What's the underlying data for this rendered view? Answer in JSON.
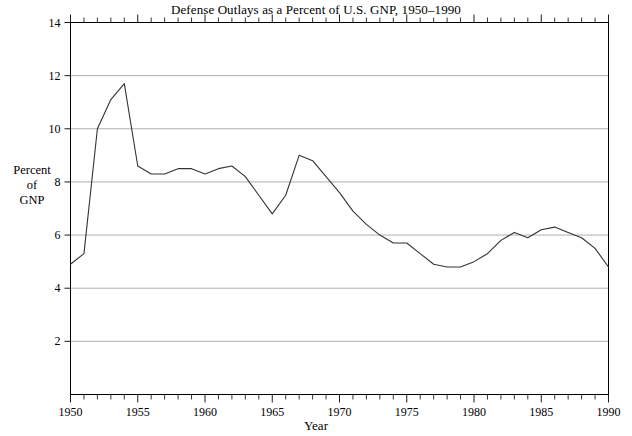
{
  "chart_data": {
    "type": "line",
    "title": "Defense Outlays as a Percent of U.S. GNP, 1950–1990",
    "xlabel": "Year",
    "ylabel": "Percent of GNP",
    "ylabel_lines": [
      "Percent",
      "of",
      "GNP"
    ],
    "xlim": [
      1950,
      1990
    ],
    "ylim": [
      0,
      14
    ],
    "yticks": [
      2,
      4,
      6,
      8,
      10,
      12,
      14
    ],
    "ytick_labels": [
      "2",
      "4",
      "6",
      "8",
      "10",
      "12",
      "14"
    ],
    "xticks": [
      1950,
      1955,
      1960,
      1965,
      1970,
      1975,
      1980,
      1985,
      1990
    ],
    "xtick_labels": [
      "1950",
      "1955",
      "1960",
      "1965",
      "1970",
      "1975",
      "1980",
      "1985",
      "1990"
    ],
    "minor_xticks_interval": 1,
    "grid": "horizontal",
    "grid_color": "#999999",
    "line_color": "#333333",
    "axis_color": "#000000",
    "background": "#ffffff",
    "legend": "none",
    "x": [
      1950,
      1951,
      1952,
      1953,
      1954,
      1955,
      1956,
      1957,
      1958,
      1959,
      1960,
      1961,
      1962,
      1963,
      1964,
      1965,
      1966,
      1967,
      1968,
      1969,
      1970,
      1971,
      1972,
      1973,
      1974,
      1975,
      1976,
      1977,
      1978,
      1979,
      1980,
      1981,
      1982,
      1983,
      1984,
      1985,
      1986,
      1987,
      1988,
      1989,
      1990
    ],
    "values": [
      4.9,
      5.3,
      10.0,
      11.1,
      11.7,
      8.6,
      8.3,
      8.3,
      8.5,
      8.5,
      8.3,
      8.5,
      8.6,
      8.2,
      7.5,
      6.8,
      7.5,
      9.0,
      8.8,
      8.2,
      7.6,
      6.9,
      6.4,
      6.0,
      5.7,
      5.7,
      5.3,
      4.9,
      4.8,
      4.8,
      5.0,
      5.3,
      5.8,
      6.1,
      5.9,
      6.2,
      6.3,
      6.1,
      5.9,
      5.5,
      4.8
    ],
    "series_name": "Defense outlays as percent of GNP"
  }
}
